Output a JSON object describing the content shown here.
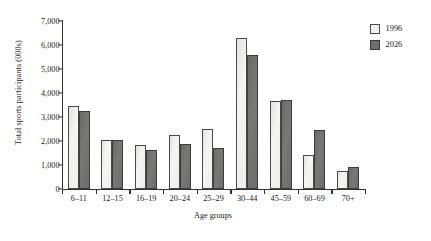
{
  "chart_data": {
    "type": "bar",
    "title": "",
    "xlabel": "Age groups",
    "ylabel": "Total sports participants (000s)",
    "categories": [
      "6–11",
      "12–15",
      "16–19",
      "20–24",
      "25–29",
      "30–44",
      "45–59",
      "60–69",
      "70+"
    ],
    "series": [
      {
        "name": "1996",
        "color": "#f2f2f1",
        "values": [
          3450,
          2050,
          1820,
          2230,
          2500,
          6300,
          3680,
          1400,
          750
        ]
      },
      {
        "name": "2026",
        "color": "#6e6e6e",
        "values": [
          3260,
          2030,
          1620,
          1880,
          1720,
          5600,
          3700,
          2450,
          900
        ]
      }
    ],
    "ylim": [
      0,
      7000
    ],
    "yticks": [
      0,
      1000,
      2000,
      3000,
      4000,
      5000,
      6000,
      7000
    ],
    "ytick_labels": [
      "0",
      "1,000",
      "2,000",
      "3,000",
      "4,000",
      "5,000",
      "6,000",
      "7,000"
    ],
    "grid": false,
    "legend_position": "top-right"
  },
  "legend": {
    "entries": [
      {
        "label": "1996"
      },
      {
        "label": "2026"
      }
    ]
  }
}
